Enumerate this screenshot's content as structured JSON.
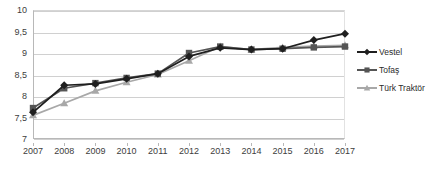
{
  "chart_data": {
    "type": "line",
    "title": "",
    "subtitle": "",
    "xlabel": "",
    "ylabel": "",
    "categories": [
      "2007",
      "2008",
      "2009",
      "2010",
      "2011",
      "2012",
      "2013",
      "2014",
      "2015",
      "2016",
      "2017"
    ],
    "x": [
      2007,
      2008,
      2009,
      2010,
      2011,
      2012,
      2013,
      2014,
      2015,
      2016,
      2017
    ],
    "ylim": [
      7,
      10
    ],
    "yticks": [
      7,
      7.5,
      8,
      8.5,
      9,
      9.5,
      10
    ],
    "ytick_labels": [
      "7",
      "7,5",
      "8",
      "8,5",
      "9",
      "9,5",
      "10"
    ],
    "grid": true,
    "legend_position": "right",
    "decimal_separator": ",",
    "series": [
      {
        "name": "Vestel",
        "color": "#1f1f1f",
        "marker": "diamond",
        "values": [
          7.62,
          8.25,
          8.28,
          8.4,
          8.52,
          8.92,
          9.12,
          9.08,
          9.1,
          9.3,
          9.45
        ]
      },
      {
        "name": "Tofaş",
        "color": "#555555",
        "marker": "square",
        "values": [
          7.72,
          8.18,
          8.3,
          8.42,
          8.52,
          9.0,
          9.15,
          9.08,
          9.1,
          9.13,
          9.15
        ]
      },
      {
        "name": "Türk Traktör",
        "color": "#a8a8a8",
        "marker": "triangle",
        "values": [
          7.55,
          7.83,
          8.12,
          8.32,
          8.5,
          8.82,
          9.15,
          9.08,
          9.13,
          9.16,
          9.18
        ]
      }
    ]
  },
  "legend": {
    "items": [
      {
        "label": "Vestel"
      },
      {
        "label": "Tofaş"
      },
      {
        "label": "Türk Traktör"
      }
    ]
  }
}
